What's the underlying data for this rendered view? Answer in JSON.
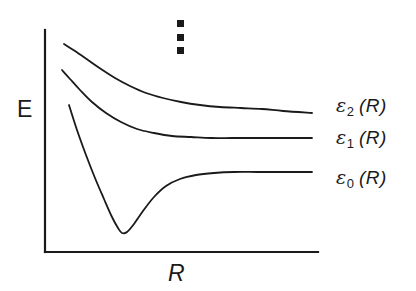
{
  "figure": {
    "background_color": "#ffffff",
    "ink_color": "#1a1a1a"
  },
  "axes": {
    "y_label": "E",
    "x_label": "R",
    "y_axis": {
      "x": 45,
      "y_top": 30,
      "y_bottom": 252
    },
    "x_axis": {
      "y": 252,
      "x_left": 45,
      "x_right": 318
    },
    "ticks": [],
    "grid": false
  },
  "annotations": {
    "vertical_ellipsis": {
      "name": "vertical-ellipsis",
      "dot_count": 3,
      "dot_shape": "square",
      "x": 180,
      "y_top": 22,
      "y_bottom": 52
    }
  },
  "curve_labels": [
    {
      "symbol": "ε",
      "subscript": "2",
      "argument": "(R)",
      "x": 336,
      "y": 96
    },
    {
      "symbol": "ε",
      "subscript": "1",
      "argument": "(R)",
      "x": 336,
      "y": 128
    },
    {
      "symbol": "ε",
      "subscript": "0",
      "argument": "(R)",
      "x": 336,
      "y": 168
    }
  ],
  "chart_data": {
    "type": "line",
    "title": "",
    "subtitle": "",
    "xlabel": "R",
    "ylabel": "E",
    "xlim": [
      45,
      318
    ],
    "ylim": [
      252,
      30
    ],
    "grid": false,
    "legend_position": "right-of-curves",
    "axis_tick_labels": {
      "x": [],
      "y": []
    },
    "note": "Schematic Born-Oppenheimer adiabatic potential energy curves; pixel coordinates, y increases downward.",
    "series": [
      {
        "name": "ε2(R)",
        "label": "ε_2 (R)",
        "color": "#1a1a1a",
        "points": [
          [
            64,
            44
          ],
          [
            75,
            51
          ],
          [
            88,
            60
          ],
          [
            101,
            69
          ],
          [
            115,
            78
          ],
          [
            130,
            86
          ],
          [
            146,
            93
          ],
          [
            163,
            98
          ],
          [
            181,
            102
          ],
          [
            200,
            105
          ],
          [
            220,
            107
          ],
          [
            241,
            108
          ],
          [
            262,
            109
          ],
          [
            283,
            111
          ],
          [
            312,
            113
          ]
        ]
      },
      {
        "name": "ε1(R)",
        "label": "ε_1 (R)",
        "color": "#1a1a1a",
        "points": [
          [
            62,
            70
          ],
          [
            70,
            79
          ],
          [
            80,
            90
          ],
          [
            92,
            102
          ],
          [
            106,
            113
          ],
          [
            121,
            122
          ],
          [
            137,
            129
          ],
          [
            154,
            133
          ],
          [
            172,
            136
          ],
          [
            191,
            137
          ],
          [
            211,
            138
          ],
          [
            232,
            138
          ],
          [
            254,
            138
          ],
          [
            278,
            138
          ],
          [
            312,
            138
          ]
        ]
      },
      {
        "name": "ε0(R)",
        "label": "ε_0 (R)",
        "color": "#1a1a1a",
        "points": [
          [
            69,
            105
          ],
          [
            77,
            130
          ],
          [
            86,
            155
          ],
          [
            95,
            178
          ],
          [
            104,
            199
          ],
          [
            112,
            217
          ],
          [
            118,
            228
          ],
          [
            122,
            233
          ],
          [
            127,
            232
          ],
          [
            134,
            224
          ],
          [
            143,
            211
          ],
          [
            154,
            197
          ],
          [
            166,
            186
          ],
          [
            180,
            179
          ],
          [
            196,
            175
          ],
          [
            214,
            173
          ],
          [
            234,
            172
          ],
          [
            258,
            172
          ],
          [
            285,
            172
          ],
          [
            312,
            172
          ]
        ]
      }
    ]
  }
}
